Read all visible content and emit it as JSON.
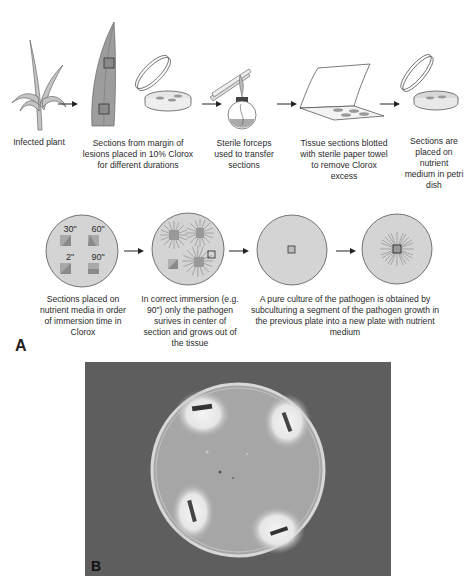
{
  "panel_a": {
    "label": "A",
    "row1": [
      {
        "id": "infected-plant",
        "caption": "Infected plant"
      },
      {
        "id": "sections-clorox",
        "caption": "Sections from margin of lesions placed in 10% Clorox for different durations"
      },
      {
        "id": "sterile-forceps",
        "caption": "Sterile forceps used to transfer sections"
      },
      {
        "id": "blotted",
        "caption": "Tissue sections blotted with sterile paper towel to remove Clorox excess"
      },
      {
        "id": "placed-petri",
        "caption": "Sections are placed on nutrient medium in petri dish"
      }
    ],
    "row2": [
      {
        "id": "immersion-order",
        "caption": "Sections placed on nutrient media in order of immersion time in Clorox",
        "times": [
          "30\"",
          "60\"",
          "2\"",
          "90\""
        ]
      },
      {
        "id": "correct-immersion",
        "caption": "In correct immersion (e.g. 90\") only the pathogen surives in center of section and grows out of the tissue"
      },
      {
        "id": "pure-culture",
        "caption": "A pure culture of the pathogen is obtained by subculturing a segment of the pathogen growth in the previous plate into a new plate with nutrient medium"
      }
    ]
  },
  "panel_b": {
    "label": "B"
  },
  "colors": {
    "line": "#3a3a3a",
    "plate_fill": "#d4d4d4",
    "tissue_fill": "#9a9a9a",
    "photo_bg": "#5e5e5e",
    "agar": "#a6a6a6",
    "mycelium": "#efefef"
  }
}
